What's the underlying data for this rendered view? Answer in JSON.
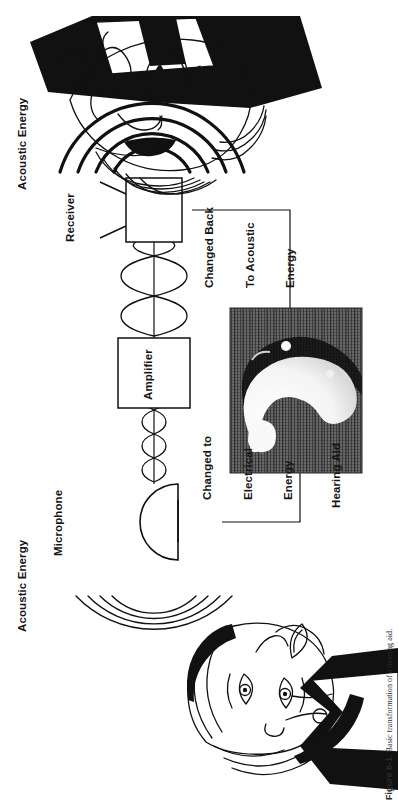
{
  "figure": {
    "number": "Figure 8-1.",
    "caption": "Basic transformation of a hearing aid.",
    "title_full": "Figure 8-1.  Basic transformation of a hearing aid."
  },
  "labels": {
    "acoustic_energy_in": "Acoustic Energy",
    "microphone": "Microphone",
    "changed_to_electrical": "Changed to\nElectrical\nEnergy",
    "changed_to_electrical_lines": [
      "Changed to",
      "Electrical",
      "Energy"
    ],
    "amplifier": "Amplifier",
    "receiver": "Receiver",
    "changed_back_acoustic": "Changed Back\nTo Acoustic\nEnergy",
    "changed_back_acoustic_lines": [
      "Changed Back",
      "To Acoustic",
      "Energy"
    ],
    "acoustic_energy_out": "Acoustic Energy",
    "hearing_aid": "Hearing Aid"
  },
  "components": {
    "microphone_shape": "semicircle-dome",
    "amplifier_shape": "rectangle-box",
    "receiver_shape": "rectangle-box-with-antenna",
    "hearing_aid_photo": "halftone-photo-in-the-ear-hearing-aid",
    "speaker_face": "line-art-woman-speaking",
    "listener_face": "line-art-older-man-with-glasses"
  },
  "diagram_flow": [
    "Acoustic Energy",
    "Microphone",
    "Changed to Electrical Energy",
    "Amplifier",
    "Receiver",
    "Changed Back To Acoustic Energy",
    "Acoustic Energy"
  ],
  "colors": {
    "ink": "#111111",
    "paper": "#ffffff",
    "photo_dark": "#4a4a4a",
    "photo_light": "#f2f2f2"
  }
}
